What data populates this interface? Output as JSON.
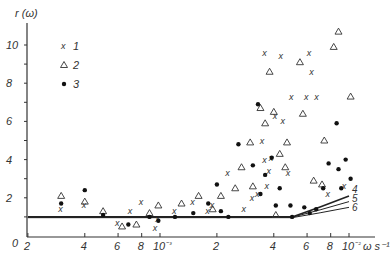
{
  "chart_data": {
    "type": "scatter",
    "title": "",
    "ylabel": "r (ω)",
    "xlabel": "ω s⁻¹",
    "xscale": "log",
    "xlim": [
      0.0002,
      0.013
    ],
    "ylim": [
      0,
      11
    ],
    "grid": false,
    "legend_position": "upper-left",
    "x_tick_labels": [
      "2",
      "4",
      "6",
      "8",
      "10⁻³",
      "2",
      "4",
      "6",
      "8",
      "10⁻²"
    ],
    "x_ticks": [
      0.0002,
      0.0004,
      0.0006,
      0.0008,
      0.001,
      0.002,
      0.004,
      0.006,
      0.008,
      0.01
    ],
    "y_tick_labels": [
      "0",
      "2",
      "4",
      "6",
      "8",
      "10"
    ],
    "y_ticks": [
      0,
      2,
      4,
      6,
      8,
      10
    ],
    "series": [
      {
        "name": "1",
        "marker": "x",
        "points": [
          [
            0.0003,
            1.4
          ],
          [
            0.0004,
            1.6
          ],
          [
            0.0006,
            0.7
          ],
          [
            0.0007,
            1.3
          ],
          [
            0.0008,
            1.8
          ],
          [
            0.00095,
            0.4
          ],
          [
            0.00098,
            0.9
          ],
          [
            0.0012,
            1.3
          ],
          [
            0.0015,
            1.8
          ],
          [
            0.0018,
            1.3
          ],
          [
            0.0019,
            1.6
          ],
          [
            0.0023,
            3.3
          ],
          [
            0.0028,
            1.4
          ],
          [
            0.0031,
            2.0
          ],
          [
            0.0033,
            2.2
          ],
          [
            0.0036,
            9.6
          ],
          [
            0.0036,
            4.0
          ],
          [
            0.0037,
            2.6
          ],
          [
            0.0038,
            3.4
          ],
          [
            0.0039,
            4.1
          ],
          [
            0.0044,
            9.4
          ],
          [
            0.0045,
            6.0
          ],
          [
            0.0048,
            3.3
          ],
          [
            0.005,
            7.3
          ],
          [
            0.006,
            7.3
          ],
          [
            0.0062,
            9.6
          ],
          [
            0.0064,
            8.6
          ],
          [
            0.0068,
            7.3
          ],
          [
            0.0078,
            2.2
          ],
          [
            0.0095,
            2.6
          ],
          [
            0.0041,
            6.3
          ],
          [
            0.0035,
            5.0
          ]
        ]
      },
      {
        "name": "2",
        "marker": "triangle-open",
        "points": [
          [
            0.0003,
            2.1
          ],
          [
            0.0004,
            1.8
          ],
          [
            0.0005,
            1.3
          ],
          [
            0.00063,
            0.5
          ],
          [
            0.00075,
            0.6
          ],
          [
            0.00088,
            1.2
          ],
          [
            0.00098,
            1.6
          ],
          [
            0.0013,
            1.7
          ],
          [
            0.0016,
            2.1
          ],
          [
            0.0019,
            1.4
          ],
          [
            0.0021,
            2.1
          ],
          [
            0.0025,
            2.5
          ],
          [
            0.0027,
            3.6
          ],
          [
            0.003,
            4.9
          ],
          [
            0.0031,
            2.6
          ],
          [
            0.0034,
            6.7
          ],
          [
            0.0036,
            5.9
          ],
          [
            0.0038,
            8.6
          ],
          [
            0.004,
            6.5
          ],
          [
            0.0041,
            1.1
          ],
          [
            0.0043,
            4.3
          ],
          [
            0.0047,
            4.9
          ],
          [
            0.0055,
            9.1
          ],
          [
            0.0057,
            6.4
          ],
          [
            0.0065,
            2.9
          ],
          [
            0.0072,
            2.7
          ],
          [
            0.0074,
            5.0
          ],
          [
            0.0088,
            10.7
          ],
          [
            0.0083,
            9.9
          ],
          [
            0.0102,
            7.3
          ],
          [
            0.0046,
            3.6
          ]
        ]
      },
      {
        "name": "3",
        "marker": "dot",
        "points": [
          [
            0.0003,
            1.7
          ],
          [
            0.0004,
            2.4
          ],
          [
            0.0005,
            1.1
          ],
          [
            0.00068,
            0.6
          ],
          [
            0.00088,
            1.0
          ],
          [
            0.00098,
            0.8
          ],
          [
            0.0012,
            1.0
          ],
          [
            0.0015,
            1.2
          ],
          [
            0.0018,
            1.7
          ],
          [
            0.002,
            2.7
          ],
          [
            0.0021,
            1.3
          ],
          [
            0.0023,
            1.0
          ],
          [
            0.0026,
            4.8
          ],
          [
            0.0031,
            3.7
          ],
          [
            0.0033,
            6.9
          ],
          [
            0.0034,
            2.2
          ],
          [
            0.0036,
            3.2
          ],
          [
            0.0039,
            4.1
          ],
          [
            0.0041,
            1.6
          ],
          [
            0.0043,
            2.5
          ],
          [
            0.0049,
            1.6
          ],
          [
            0.005,
            1.0
          ],
          [
            0.0058,
            1.5
          ],
          [
            0.0062,
            1.2
          ],
          [
            0.0067,
            1.4
          ],
          [
            0.0073,
            2.5
          ],
          [
            0.0078,
            3.8
          ],
          [
            0.0086,
            5.9
          ],
          [
            0.0088,
            3.5
          ],
          [
            0.0096,
            4.0
          ],
          [
            0.0102,
            3.0
          ],
          [
            0.0091,
            2.5
          ]
        ]
      }
    ],
    "curves": [
      {
        "name": "4",
        "points": [
          [
            0.0002,
            1.0
          ],
          [
            0.005,
            1.0
          ],
          [
            0.007,
            1.5
          ],
          [
            0.01,
            2.1
          ]
        ]
      },
      {
        "name": "5",
        "points": [
          [
            0.0002,
            0.98
          ],
          [
            0.005,
            0.98
          ],
          [
            0.007,
            1.35
          ],
          [
            0.01,
            1.8
          ]
        ]
      },
      {
        "name": "6",
        "points": [
          [
            0.0002,
            0.96
          ],
          [
            0.005,
            0.96
          ],
          [
            0.007,
            1.2
          ],
          [
            0.01,
            1.5
          ]
        ]
      }
    ],
    "legend": [
      {
        "marker": "x",
        "label": "1"
      },
      {
        "marker": "triangle-open",
        "label": "2"
      },
      {
        "marker": "dot",
        "label": "3"
      }
    ],
    "curve_labels": [
      "4",
      "5",
      "6"
    ]
  },
  "axis": {
    "ylabel": "r (ω)",
    "xlabel_unit": "ω s⁻¹",
    "origin_label": "0"
  }
}
